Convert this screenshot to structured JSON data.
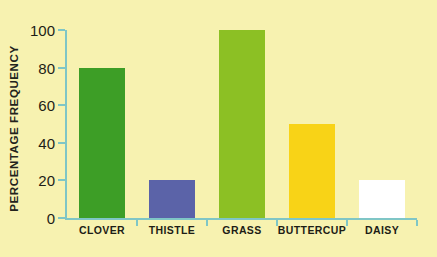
{
  "chart_data": {
    "type": "bar",
    "title": "",
    "subtitle": "",
    "xlabel": "",
    "ylabel": "PERCENTAGE FREQUENCY",
    "categories": [
      "CLOVER",
      "THISTLE",
      "GRASS",
      "BUTTERCUP",
      "DAISY"
    ],
    "values": [
      80,
      20,
      100,
      50,
      20
    ],
    "bar_colors": [
      "#3D9E26",
      "#5B63A8",
      "#8CC024",
      "#F8D317",
      "#FFFFFF"
    ],
    "ylim": [
      0,
      100
    ],
    "ytick_labels": [
      "0",
      "20",
      "40",
      "60",
      "80",
      "100"
    ],
    "ytick_values": [
      0,
      20,
      40,
      60,
      80,
      100
    ],
    "grid": false,
    "legend": "none",
    "background_color": "#F7F2B0",
    "axis_color": "#7FC6C6",
    "text_color": "#1d1d16"
  }
}
